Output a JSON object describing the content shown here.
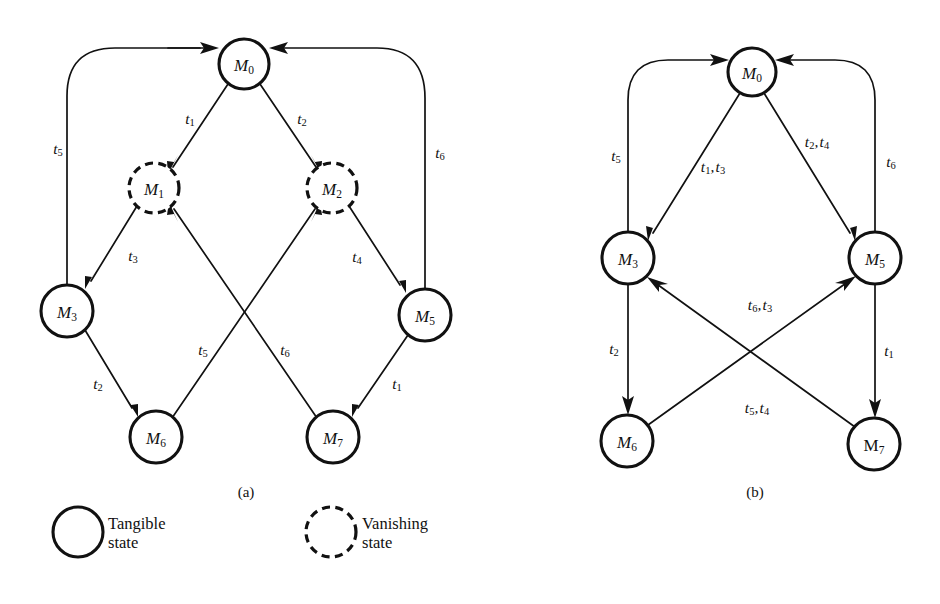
{
  "figure": {
    "subfigures": [
      {
        "id": "a",
        "caption": "(a)"
      },
      {
        "id": "b",
        "caption": "(b)"
      }
    ]
  },
  "diagram_a": {
    "caption": "(a)",
    "nodes": [
      {
        "id": "M0",
        "label": "M",
        "sub": "0",
        "type": "tangible",
        "cx": 244,
        "cy": 64,
        "r": 25
      },
      {
        "id": "M1",
        "label": "M",
        "sub": "1",
        "type": "vanishing",
        "cx": 154,
        "cy": 188,
        "r": 25
      },
      {
        "id": "M2",
        "label": "M",
        "sub": "2",
        "type": "vanishing",
        "cx": 332,
        "cy": 188,
        "r": 25
      },
      {
        "id": "M3",
        "label": "M",
        "sub": "3",
        "type": "tangible",
        "cx": 67,
        "cy": 311,
        "r": 26
      },
      {
        "id": "M5",
        "label": "M",
        "sub": "5",
        "type": "tangible",
        "cx": 425,
        "cy": 315,
        "r": 26
      },
      {
        "id": "M6",
        "label": "M",
        "sub": "6",
        "type": "tangible",
        "cx": 156,
        "cy": 437,
        "r": 26
      },
      {
        "id": "M7",
        "label": "M",
        "sub": "7",
        "type": "tangible",
        "cx": 333,
        "cy": 437,
        "r": 26
      }
    ],
    "edges": [
      {
        "from": "M0",
        "to": "M1",
        "label": "t",
        "sub": "1",
        "lx": 190,
        "ly": 118
      },
      {
        "from": "M0",
        "to": "M2",
        "label": "t",
        "sub": "2",
        "lx": 302,
        "ly": 118
      },
      {
        "from": "M3",
        "to": "M1",
        "label": "t",
        "sub": "3",
        "lx": 133,
        "ly": 255
      },
      {
        "from": "M5",
        "to": "M2",
        "label": "t",
        "sub": "4",
        "lx": 357,
        "ly": 256
      },
      {
        "from": "M3",
        "to": "M0",
        "label": "t",
        "sub": "5",
        "lx": 58,
        "ly": 148
      },
      {
        "from": "M5",
        "to": "M0",
        "label": "t",
        "sub": "6",
        "lx": 440,
        "ly": 152
      },
      {
        "from": "M3",
        "to": "M6",
        "label": "t",
        "sub": "2",
        "lx": 98,
        "ly": 383
      },
      {
        "from": "M5",
        "to": "M7",
        "label": "t",
        "sub": "1",
        "lx": 397,
        "ly": 383
      },
      {
        "from": "M6",
        "to": "M2",
        "label": "t",
        "sub": "5",
        "lx": 203,
        "ly": 349
      },
      {
        "from": "M7",
        "to": "M1",
        "label": "t",
        "sub": "6",
        "lx": 285,
        "ly": 349
      }
    ]
  },
  "diagram_b": {
    "caption": "(b)",
    "nodes": [
      {
        "id": "M0",
        "label": "M",
        "sub": "0",
        "type": "tangible",
        "cx": 752,
        "cy": 72,
        "r": 24
      },
      {
        "id": "M3",
        "label": "M",
        "sub": "3",
        "type": "tangible",
        "cx": 628,
        "cy": 258,
        "r": 26
      },
      {
        "id": "M5",
        "label": "M",
        "sub": "5",
        "type": "tangible",
        "cx": 875,
        "cy": 258,
        "r": 26
      },
      {
        "id": "M6",
        "label": "M",
        "sub": "6",
        "type": "tangible",
        "cx": 627,
        "cy": 441,
        "r": 26
      },
      {
        "id": "M7",
        "label": "M",
        "sub": "7",
        "type": "tangible",
        "cx": 874,
        "cy": 444,
        "r": 26,
        "upright": true
      }
    ],
    "edges": [
      {
        "from": "M0",
        "to": "M3",
        "label": "t",
        "sub": "1",
        "label2": "t",
        "sub2": "3",
        "lx": 713,
        "ly": 166
      },
      {
        "from": "M0",
        "to": "M5",
        "label": "t",
        "sub": "2",
        "label2": "t",
        "sub2": "4",
        "lx": 817,
        "ly": 141
      },
      {
        "from": "M3",
        "to": "M0",
        "label": "t",
        "sub": "5",
        "lx": 616,
        "ly": 155
      },
      {
        "from": "M5",
        "to": "M0",
        "label": "t",
        "sub": "6",
        "lx": 891,
        "ly": 161
      },
      {
        "from": "M3",
        "to": "M6",
        "label": "t",
        "sub": "2",
        "lx": 614,
        "ly": 348
      },
      {
        "from": "M5",
        "to": "M7",
        "label": "t",
        "sub": "1",
        "lx": 889,
        "ly": 350
      },
      {
        "from": "M7",
        "to": "M3",
        "label": "t",
        "sub": "6",
        "label2": "t",
        "sub2": "3",
        "lx": 760,
        "ly": 304
      },
      {
        "from": "M6",
        "to": "M5",
        "label": "t",
        "sub": "5",
        "label2": "t",
        "sub2": "4",
        "lx": 757,
        "ly": 407
      }
    ]
  },
  "legend": {
    "tangible": {
      "shape": "solid-circle",
      "text": "Tangible\nstate"
    },
    "vanishing": {
      "shape": "dashed-circle",
      "text": "Vanishing\nstate"
    }
  },
  "colors": {
    "background": "#ffffff",
    "ink": "#111111"
  }
}
